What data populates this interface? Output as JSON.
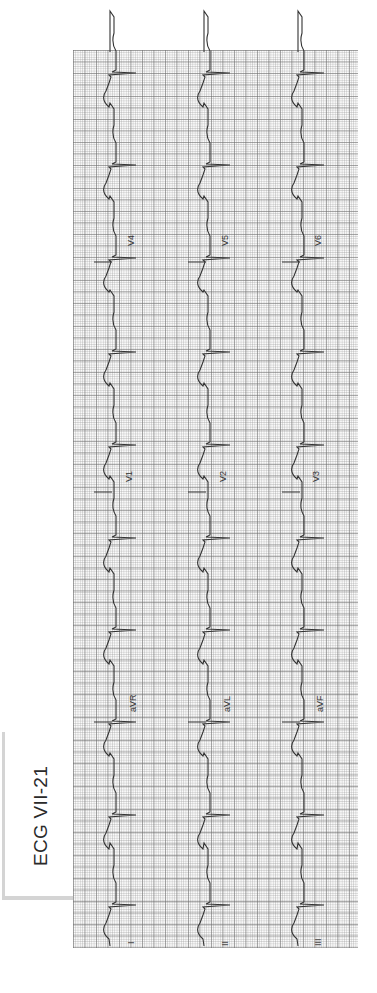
{
  "figure": {
    "title": "ECG VII-21",
    "orientation": "rotated 90° counter-clockwise (time runs bottom to top)",
    "grid_color": "#8c8c8c",
    "trace_color": "#333333"
  },
  "rows": [
    {
      "name": "row-1",
      "leads": [
        {
          "label": "I",
          "x": 130,
          "y": 938
        },
        {
          "label": "aVR",
          "x": 130,
          "y": 712
        },
        {
          "label": "V1",
          "x": 130,
          "y": 482
        },
        {
          "label": "V4",
          "x": 130,
          "y": 252
        }
      ]
    },
    {
      "name": "row-2",
      "leads": [
        {
          "label": "II",
          "x": 225,
          "y": 938
        },
        {
          "label": "aVL",
          "x": 225,
          "y": 712
        },
        {
          "label": "V2",
          "x": 225,
          "y": 482
        },
        {
          "label": "V5",
          "x": 225,
          "y": 252
        }
      ]
    },
    {
      "name": "row-3",
      "leads": [
        {
          "label": "III",
          "x": 318,
          "y": 938
        },
        {
          "label": "aVF",
          "x": 318,
          "y": 712
        },
        {
          "label": "V3",
          "x": 318,
          "y": 482
        },
        {
          "label": "V6",
          "x": 318,
          "y": 252
        }
      ]
    }
  ],
  "labels": {
    "l1": "I",
    "l2": "II",
    "l3": "III",
    "avr": "aVR",
    "avl": "aVL",
    "avf": "aVF",
    "v1": "V1",
    "v2": "V2",
    "v3": "V3",
    "v4": "V4",
    "v5": "V5",
    "v6": "V6"
  },
  "beats_y": [
    73,
    165,
    258,
    352,
    445,
    538,
    630,
    722,
    815,
    905
  ]
}
